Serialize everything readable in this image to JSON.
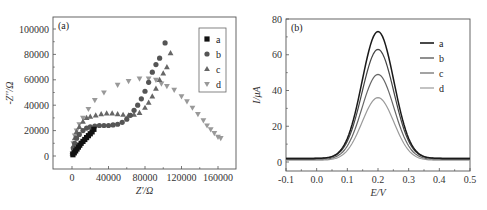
{
  "chart_data": [
    {
      "type": "scatter",
      "panel_label": "(a)",
      "title": "",
      "xlabel": "Z'/Ω",
      "ylabel": "-Z''/Ω",
      "xlim": [
        -12000,
        180000
      ],
      "ylim": [
        -10000,
        110000
      ],
      "xticks": [
        0,
        40000,
        80000,
        120000,
        160000
      ],
      "xtick_labels": [
        "0",
        "40000",
        "80000",
        "120000",
        "160000"
      ],
      "yticks": [
        0,
        20000,
        40000,
        60000,
        80000,
        100000
      ],
      "ytick_labels": [
        "0",
        "20000",
        "40000",
        "60000",
        "80000",
        "100000"
      ],
      "grid": false,
      "legend_position": "upper right",
      "series": [
        {
          "name": "a",
          "marker": "square",
          "color": "#111111",
          "x": [
            1000,
            2500,
            4000,
            5500,
            7000,
            8500,
            10000,
            12000,
            14000,
            16000,
            18000,
            20000,
            22000,
            24000
          ],
          "y": [
            1000,
            2500,
            4000,
            5500,
            7000,
            8500,
            10000,
            11500,
            13000,
            14500,
            16000,
            17500,
            19000,
            21000
          ]
        },
        {
          "name": "b",
          "marker": "circle",
          "color": "#555555",
          "x": [
            500,
            1500,
            3000,
            5000,
            8000,
            12000,
            16000,
            20000,
            25000,
            30000,
            35000,
            40000,
            45000,
            50000,
            55000,
            60000,
            64000,
            68000,
            72000,
            76000,
            80000,
            84000,
            88000,
            92000,
            96000,
            102000
          ],
          "y": [
            2000,
            6000,
            10000,
            14000,
            17000,
            20000,
            22000,
            23000,
            23500,
            24000,
            24000,
            24000,
            24500,
            25000,
            26500,
            29000,
            32000,
            36000,
            40000,
            45000,
            51000,
            58000,
            66000,
            72000,
            77000,
            89000
          ]
        },
        {
          "name": "c",
          "marker": "triangle-up",
          "color": "#666666",
          "x": [
            500,
            1500,
            3000,
            5000,
            8000,
            12000,
            16000,
            20000,
            26000,
            32000,
            38000,
            44000,
            50000,
            56000,
            62000,
            68000,
            74000,
            80000,
            84000,
            88000,
            92000,
            96000,
            100000,
            104000,
            108000
          ],
          "y": [
            2000,
            8000,
            14000,
            19000,
            23000,
            27000,
            30000,
            31000,
            32000,
            33000,
            33500,
            33500,
            33000,
            32500,
            32000,
            32500,
            34000,
            38000,
            42000,
            47000,
            53000,
            60000,
            65000,
            70000,
            81000
          ]
        },
        {
          "name": "d",
          "marker": "triangle-down",
          "color": "#999999",
          "x": [
            500,
            1500,
            3000,
            5000,
            8000,
            12000,
            18000,
            25000,
            35000,
            50000,
            62000,
            74000,
            84000,
            92000,
            98000,
            104000,
            112000,
            120000,
            126000,
            132000,
            138000,
            144000,
            148000,
            152000,
            156000,
            160000,
            163000
          ],
          "y": [
            2000,
            10000,
            16000,
            20000,
            25000,
            30000,
            37000,
            44000,
            50000,
            56000,
            59000,
            61000,
            61000,
            60000,
            57000,
            55000,
            52000,
            47000,
            43000,
            38000,
            33000,
            28000,
            24000,
            21000,
            18000,
            15000,
            14000
          ]
        }
      ]
    },
    {
      "type": "line",
      "panel_label": "(b)",
      "title": "",
      "xlabel": "E/V",
      "ylabel": "I/μA",
      "xlim": [
        -0.1,
        0.5
      ],
      "ylim": [
        -5,
        80
      ],
      "xticks": [
        -0.1,
        0.0,
        0.1,
        0.2,
        0.3,
        0.4,
        0.5
      ],
      "xtick_labels": [
        "-0.1",
        "0.0",
        "0.1",
        "0.2",
        "0.3",
        "0.4",
        "0.5"
      ],
      "yticks": [
        0,
        20,
        40,
        60,
        80
      ],
      "ytick_labels": [
        "0",
        "20",
        "40",
        "60",
        "80"
      ],
      "grid": false,
      "legend_position": "upper right",
      "x": [
        -0.1,
        -0.05,
        0.0,
        0.05,
        0.08,
        0.1,
        0.12,
        0.14,
        0.16,
        0.18,
        0.2,
        0.22,
        0.24,
        0.26,
        0.28,
        0.3,
        0.33,
        0.36,
        0.4,
        0.45,
        0.5
      ],
      "series": [
        {
          "name": "a",
          "color": "#1a1a1a",
          "peak": 73,
          "values": [
            2,
            2,
            2.5,
            5,
            9,
            15,
            25,
            39,
            55,
            68,
            73,
            68,
            55,
            39,
            25,
            13,
            6,
            3,
            2,
            2,
            2
          ]
        },
        {
          "name": "b",
          "color": "#444444",
          "peak": 63,
          "values": [
            2,
            2,
            2.5,
            5,
            9,
            14,
            22,
            34,
            48,
            59,
            63,
            59,
            48,
            34,
            22,
            12,
            5.5,
            3,
            2,
            2,
            2
          ]
        },
        {
          "name": "c",
          "color": "#666666",
          "peak": 49,
          "values": [
            1.5,
            1.5,
            2,
            4.5,
            8,
            12,
            18,
            27,
            38,
            46,
            49,
            46,
            38,
            27,
            18,
            10,
            5,
            2.5,
            1.5,
            1.5,
            1.5
          ]
        },
        {
          "name": "d",
          "color": "#9a9a9a",
          "peak": 36,
          "values": [
            1,
            1,
            1.5,
            3.5,
            6,
            9,
            14,
            20,
            28,
            34,
            36,
            34,
            28,
            20,
            14,
            8,
            4,
            2,
            1,
            1,
            1
          ]
        }
      ]
    }
  ]
}
